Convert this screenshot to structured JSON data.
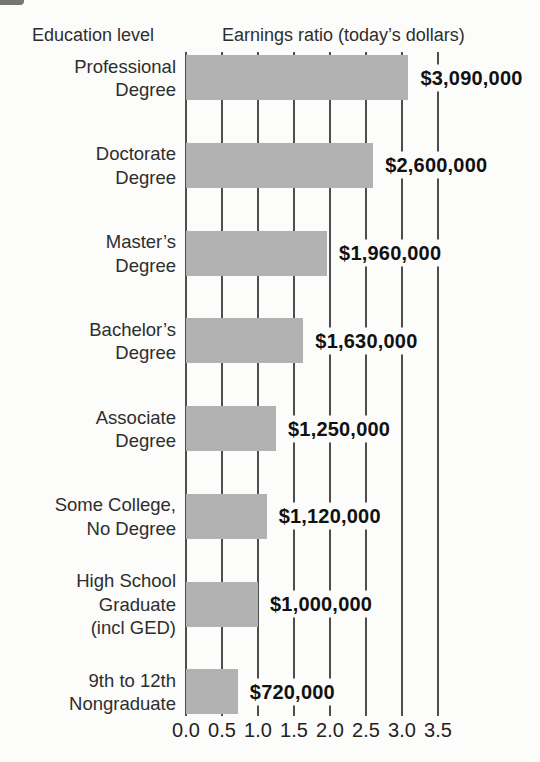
{
  "header": {
    "education_level": "Education level",
    "earnings_title": "Earnings ratio (today’s dollars)"
  },
  "chart_data": {
    "type": "bar",
    "orientation": "horizontal",
    "title": "Earnings ratio (today’s dollars)",
    "category_axis_title": "Education level",
    "categories": [
      "Professional\nDegree",
      "Doctorate\nDegree",
      "Master’s\nDegree",
      "Bachelor’s\nDegree",
      "Associate\nDegree",
      "Some College,\nNo Degree",
      "High School\nGraduate\n(incl GED)",
      "9th to 12th\nNongraduate"
    ],
    "values": [
      3.09,
      2.6,
      1.96,
      1.63,
      1.25,
      1.12,
      1.0,
      0.72
    ],
    "value_labels": [
      "$3,090,000",
      "$2,600,000",
      "$1,960,000",
      "$1,630,000",
      "$1,250,000",
      "$1,120,000",
      "$1,000,000",
      "$720,000"
    ],
    "x_ticks": [
      "0.0",
      "0.5",
      "1.0",
      "1.5",
      "2.0",
      "2.5",
      "3.0",
      "3.5"
    ],
    "xlim": [
      0,
      3.5
    ],
    "grid": "on",
    "legend": "none",
    "bar_color": "#b2b2b2",
    "gridline_color": "#4e4e4e",
    "background": "#fcfcfb"
  }
}
